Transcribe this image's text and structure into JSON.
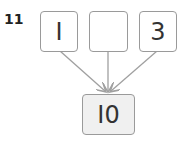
{
  "problem": {
    "number": "11"
  },
  "top_boxes": [
    {
      "value": "I"
    },
    {
      "value": ""
    },
    {
      "value": "3"
    }
  ],
  "result_box": {
    "value": "I0"
  },
  "colors": {
    "border": "#9a9a9a",
    "arrow": "#a0a0a0",
    "result_fill": "#f0f0f0"
  }
}
